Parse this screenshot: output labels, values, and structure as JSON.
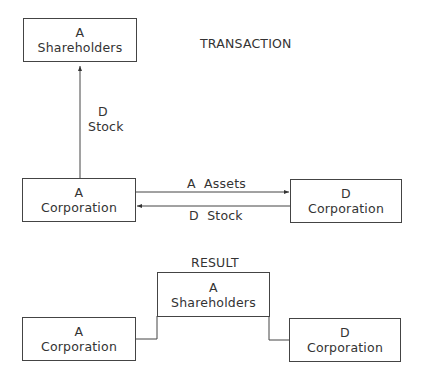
{
  "transaction": {
    "title": "TRANSACTION",
    "shareholders_box": {
      "line1": "A",
      "line2": "Shareholders"
    },
    "a_corp_box": {
      "line1": "A",
      "line2": "Corporation"
    },
    "d_corp_box": {
      "line1": "D",
      "line2": "Corporation"
    },
    "vertical_arrow_label": {
      "line1": "D",
      "line2": "Stock"
    },
    "right_arrow_label": "A  Assets",
    "left_arrow_label": "D  Stock"
  },
  "result": {
    "title": "RESULT",
    "shareholders_box": {
      "line1": "A",
      "line2": "Shareholders"
    },
    "a_corp_box": {
      "line1": "A",
      "line2": "Corporation"
    },
    "d_corp_box": {
      "line1": "D",
      "line2": "Corporation"
    }
  },
  "colors": {
    "line": "#444444",
    "text": "#333333",
    "background": "#ffffff"
  }
}
